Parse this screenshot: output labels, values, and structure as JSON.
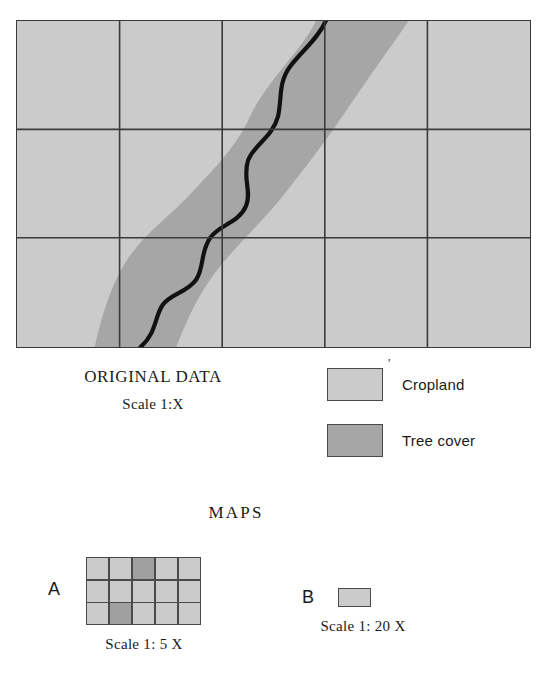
{
  "figure": {
    "original_data": {
      "title": "ORIGINAL DATA",
      "scale": "Scale 1:X"
    },
    "maps_heading": "MAPS",
    "legend": {
      "tick_mark": "'",
      "items": [
        {
          "label": "Cropland",
          "color": "#cbcbcb",
          "swatch_name": "cropland-swatch"
        },
        {
          "label": "Tree cover",
          "color": "#a6a6a6",
          "swatch_name": "tree-cover-swatch"
        }
      ]
    },
    "map_a": {
      "letter": "A",
      "scale": "Scale 1: 5 X",
      "columns": 5,
      "rows": 3,
      "cells": [
        "cropland",
        "cropland",
        "treecover",
        "cropland",
        "cropland",
        "cropland",
        "cropland",
        "cropland",
        "cropland",
        "cropland",
        "cropland",
        "treecover",
        "cropland",
        "cropland",
        "cropland"
      ]
    },
    "map_b": {
      "letter": "B",
      "scale": "Scale 1: 20 X",
      "fill": "cropland"
    }
  },
  "chart_data": {
    "type": "map",
    "title": "ORIGINAL DATA",
    "original_grid": {
      "columns": 5,
      "rows": 3
    },
    "classes": [
      {
        "name": "Cropland",
        "color": "#cbcbcb"
      },
      {
        "name": "Tree cover",
        "color": "#a6a6a6"
      }
    ],
    "river_line_color": "#111111",
    "scales": [
      "1:X",
      "1: 5 X",
      "1: 20 X"
    ],
    "map_a_cells": [
      "cropland",
      "cropland",
      "treecover",
      "cropland",
      "cropland",
      "cropland",
      "cropland",
      "cropland",
      "cropland",
      "cropland",
      "cropland",
      "treecover",
      "cropland",
      "cropland",
      "cropland"
    ],
    "map_b_cells": [
      "cropland"
    ]
  }
}
